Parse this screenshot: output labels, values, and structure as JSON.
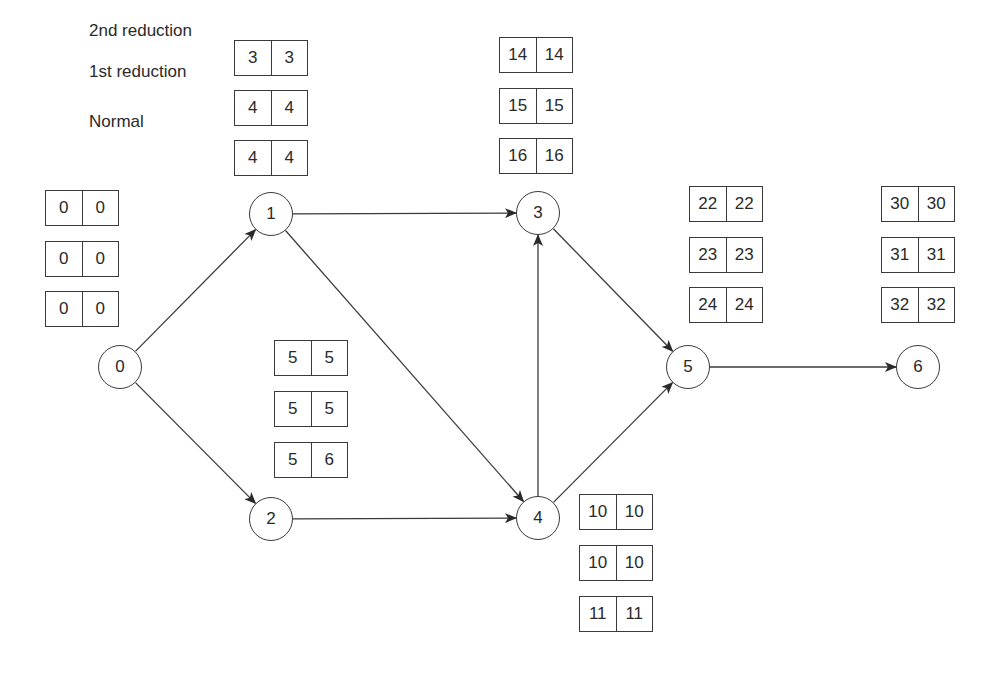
{
  "legend": {
    "rows": [
      {
        "label": "2nd reduction"
      },
      {
        "label": "1st reduction"
      },
      {
        "label": "Normal"
      }
    ]
  },
  "nodes": [
    {
      "id": "0",
      "label": "0",
      "x": 120,
      "y": 367
    },
    {
      "id": "1",
      "label": "1",
      "x": 271,
      "y": 214
    },
    {
      "id": "2",
      "label": "2",
      "x": 271,
      "y": 519
    },
    {
      "id": "3",
      "label": "3",
      "x": 538,
      "y": 213
    },
    {
      "id": "4",
      "label": "4",
      "x": 538,
      "y": 518
    },
    {
      "id": "5",
      "label": "5",
      "x": 688,
      "y": 367
    },
    {
      "id": "6",
      "label": "6",
      "x": 918,
      "y": 367
    }
  ],
  "edges": [
    {
      "from": "0",
      "to": "1"
    },
    {
      "from": "0",
      "to": "2"
    },
    {
      "from": "1",
      "to": "3"
    },
    {
      "from": "1",
      "to": "4"
    },
    {
      "from": "2",
      "to": "4"
    },
    {
      "from": "4",
      "to": "3"
    },
    {
      "from": "3",
      "to": "5"
    },
    {
      "from": "4",
      "to": "5"
    },
    {
      "from": "5",
      "to": "6"
    }
  ],
  "time_boxes": {
    "node0": [
      {
        "stage": "2nd reduction",
        "es": "0",
        "lf": "0"
      },
      {
        "stage": "1st reduction",
        "es": "0",
        "lf": "0"
      },
      {
        "stage": "Normal",
        "es": "0",
        "lf": "0"
      }
    ],
    "node1": [
      {
        "stage": "2nd reduction",
        "es": "3",
        "lf": "3"
      },
      {
        "stage": "1st reduction",
        "es": "4",
        "lf": "4"
      },
      {
        "stage": "Normal",
        "es": "4",
        "lf": "4"
      }
    ],
    "node2": [
      {
        "stage": "2nd reduction",
        "es": "5",
        "lf": "5"
      },
      {
        "stage": "1st reduction",
        "es": "5",
        "lf": "5"
      },
      {
        "stage": "Normal",
        "es": "5",
        "lf": "6"
      }
    ],
    "node3": [
      {
        "stage": "2nd reduction",
        "es": "14",
        "lf": "14"
      },
      {
        "stage": "1st reduction",
        "es": "15",
        "lf": "15"
      },
      {
        "stage": "Normal",
        "es": "16",
        "lf": "16"
      }
    ],
    "node4": [
      {
        "stage": "2nd reduction",
        "es": "10",
        "lf": "10"
      },
      {
        "stage": "1st reduction",
        "es": "10",
        "lf": "10"
      },
      {
        "stage": "Normal",
        "es": "11",
        "lf": "11"
      }
    ],
    "node5": [
      {
        "stage": "2nd reduction",
        "es": "22",
        "lf": "22"
      },
      {
        "stage": "1st reduction",
        "es": "23",
        "lf": "23"
      },
      {
        "stage": "Normal",
        "es": "24",
        "lf": "24"
      }
    ],
    "node6": [
      {
        "stage": "2nd reduction",
        "es": "30",
        "lf": "30"
      },
      {
        "stage": "1st reduction",
        "es": "31",
        "lf": "31"
      },
      {
        "stage": "Normal",
        "es": "32",
        "lf": "32"
      }
    ]
  },
  "colors": {
    "stroke": "#3a3a3a",
    "text": "#2a2a2a",
    "background": "#ffffff"
  }
}
